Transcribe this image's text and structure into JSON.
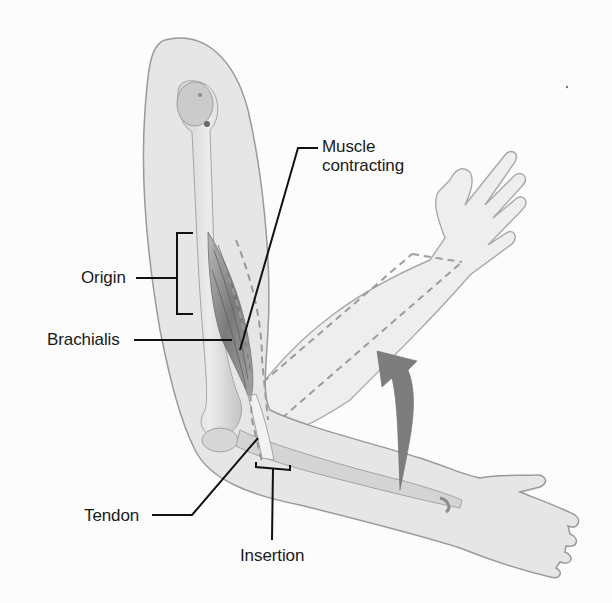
{
  "figure": {
    "labels": {
      "muscle_contracting": "Muscle\ncontracting",
      "origin": "Origin",
      "brachialis": "Brachialis",
      "tendon": "Tendon",
      "insertion": "Insertion"
    },
    "colors": {
      "background": "#fcfcfc",
      "skin_fill": "#e6e6e6",
      "skin_outline": "#9a9a9a",
      "bone": "#d4d4d4",
      "muscle": "#8a8a8a",
      "arrow": "#7d7d7d",
      "leader_lines": "#111111",
      "dashed_lines": "#9c9c9c",
      "text": "#1a1a1a"
    }
  }
}
